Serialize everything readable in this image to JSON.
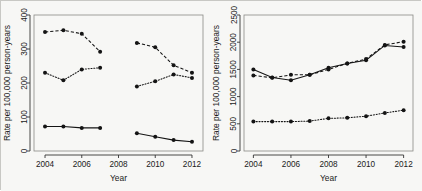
{
  "figure": {
    "background_color": "#f7f7f5",
    "border_color": "#c8c8c4",
    "axis_color": "#333333",
    "series_color": "#141414"
  },
  "chart_data": [
    {
      "id": "left",
      "type": "line",
      "title": "",
      "xlabel": "Year",
      "ylabel": "Rate per 100,000 person-years",
      "xlim": [
        2003.4,
        2012.6
      ],
      "ylim": [
        0,
        400
      ],
      "xticks": [
        2004,
        2006,
        2008,
        2010,
        2012
      ],
      "xtick_labels": [
        "2004",
        "2006",
        "2008",
        "2010",
        "2012"
      ],
      "yticks": [
        0,
        100,
        200,
        300,
        400
      ],
      "ytick_labels": [
        "0",
        "100",
        "200",
        "300",
        "400"
      ],
      "grid": false,
      "legend": "none",
      "note": "Two disjoint time segments: 2004-2007 and 2009-2012",
      "series": [
        {
          "name": "upper-dashed",
          "style": "dashed",
          "segments": [
            {
              "x": [
                2004,
                2005,
                2006,
                2007
              ],
              "y": [
                350,
                355,
                345,
                292
              ]
            },
            {
              "x": [
                2009,
                2010,
                2011,
                2012
              ],
              "y": [
                318,
                305,
                252,
                230
              ]
            }
          ]
        },
        {
          "name": "middle-dotted",
          "style": "dotted",
          "segments": [
            {
              "x": [
                2004,
                2005,
                2006,
                2007
              ],
              "y": [
                230,
                208,
                240,
                245
              ]
            },
            {
              "x": [
                2009,
                2010,
                2011,
                2012
              ],
              "y": [
                190,
                205,
                225,
                215
              ]
            }
          ]
        },
        {
          "name": "lower-solid",
          "style": "solid",
          "segments": [
            {
              "x": [
                2004,
                2005,
                2006,
                2007
              ],
              "y": [
                72,
                72,
                68,
                68
              ]
            },
            {
              "x": [
                2009,
                2010,
                2011,
                2012
              ],
              "y": [
                52,
                42,
                32,
                27
              ]
            }
          ]
        }
      ]
    },
    {
      "id": "right",
      "type": "line",
      "title": "",
      "xlabel": "Year",
      "ylabel": "Rate per 100,000 person-years",
      "xlim": [
        2003.5,
        2012.5
      ],
      "ylim": [
        0,
        2500
      ],
      "xticks": [
        2004,
        2006,
        2008,
        2010,
        2012
      ],
      "xtick_labels": [
        "2004",
        "2006",
        "2008",
        "2010",
        "2012"
      ],
      "yticks": [
        0,
        500,
        1000,
        1500,
        2000,
        2500
      ],
      "ytick_labels": [
        "0",
        "500",
        "1000",
        "1500",
        "2000",
        "2500"
      ],
      "grid": false,
      "legend": "none",
      "note": "Continuous series 2004-2012",
      "series": [
        {
          "name": "upper-solid",
          "style": "solid",
          "segments": [
            {
              "x": [
                2004,
                2005,
                2006,
                2007,
                2008,
                2009,
                2010,
                2011,
                2012
              ],
              "y": [
                1500,
                1350,
                1300,
                1400,
                1530,
                1610,
                1670,
                1940,
                1910
              ]
            }
          ]
        },
        {
          "name": "upper-dashed",
          "style": "dashed",
          "segments": [
            {
              "x": [
                2004,
                2005,
                2006,
                2007,
                2008,
                2009,
                2010,
                2011,
                2012
              ],
              "y": [
                1390,
                1345,
                1400,
                1400,
                1500,
                1610,
                1690,
                1950,
                2010
              ]
            }
          ]
        },
        {
          "name": "lower-dotted",
          "style": "dotted",
          "segments": [
            {
              "x": [
                2004,
                2005,
                2006,
                2007,
                2008,
                2009,
                2010,
                2011,
                2012
              ],
              "y": [
                540,
                540,
                540,
                550,
                600,
                610,
                640,
                700,
                750
              ]
            }
          ]
        }
      ]
    }
  ]
}
